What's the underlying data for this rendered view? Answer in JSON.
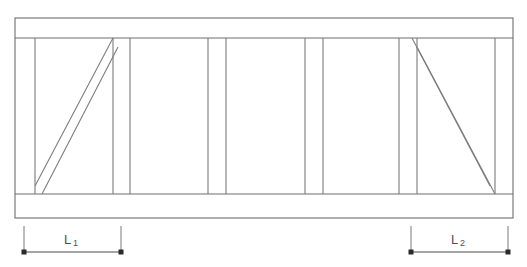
{
  "diagram": {
    "type": "technical-line-drawing",
    "colors": {
      "line": "#6e6e6e",
      "post": "#7a7a7a",
      "brace": "#7d7d7d",
      "dimension": "#4a4a4a",
      "label": "#4f4f4f",
      "background": "#ffffff"
    },
    "outer_frame": {
      "left": 15,
      "right": 513,
      "top": 18,
      "bottom": 218
    },
    "rails": {
      "top_rail_bottom": 38,
      "bottom_rail_top": 194
    },
    "posts_x": [
      35,
      113,
      130,
      208,
      226,
      305,
      323,
      399,
      417,
      495
    ],
    "braces": [
      {
        "name": "left-brace",
        "direction": "up-right",
        "x1": 35,
        "y1": 194,
        "x2": 113,
        "y2": 38,
        "offset": 10
      },
      {
        "name": "right-brace",
        "direction": "down-right",
        "x1": 417,
        "y1": 38,
        "x2": 495,
        "y2": 194,
        "offset": 10
      }
    ],
    "dimensions": [
      {
        "name": "dimension-l1",
        "label": "L",
        "subscript": "1",
        "start_x": 24,
        "end_x": 121,
        "line_y": 252,
        "ext_top_y": 226,
        "label_x": 71,
        "label_y": 243
      },
      {
        "name": "dimension-l2",
        "label": "L",
        "subscript": "2",
        "start_x": 411,
        "end_x": 508,
        "line_y": 252,
        "ext_top_y": 226,
        "label_x": 458,
        "label_y": 243
      }
    ]
  }
}
